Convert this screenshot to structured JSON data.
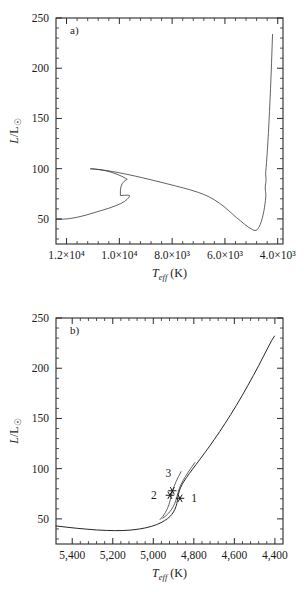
{
  "figure": {
    "kind": "two-panel-hr-diagram",
    "background": "#ffffff",
    "ink": "#262626",
    "top_cropped_text": ""
  },
  "chart_data": [
    {
      "type": "line",
      "panel": "a",
      "panel_label": "a)",
      "title": "",
      "xlabel": "T_eff (K)",
      "ylabel": "L/L☉",
      "xlim": [
        12400,
        3800
      ],
      "ylim": [
        25,
        250
      ],
      "x_reversed": true,
      "grid": false,
      "legend": "none",
      "xticks": [
        12000,
        10000,
        8000,
        6000,
        4000
      ],
      "xticklabels": [
        "1.2×10⁴",
        "1.0×10⁴",
        "8.0×10³",
        "6.0×10³",
        "4.0×10³"
      ],
      "xminor_per_interval": 4,
      "yticks": [
        50,
        100,
        150,
        200,
        250
      ],
      "yticklabels": [
        "50",
        "100",
        "150",
        "200",
        "250"
      ],
      "yminor_per_interval": 4,
      "series": [
        {
          "name": "evolutionary-track",
          "comment": "main sequence to RGB tip; x = Teff (K), y = L/Lsun",
          "points": [
            [
              12400,
              49.5
            ],
            [
              12200,
              49.6
            ],
            [
              11900,
              50.2
            ],
            [
              11600,
              51.6
            ],
            [
              11300,
              53.5
            ],
            [
              11000,
              55.8
            ],
            [
              10700,
              58.2
            ],
            [
              10400,
              60.6
            ],
            [
              10150,
              63.0
            ],
            [
              9950,
              65.2
            ],
            [
              9800,
              67.4
            ],
            [
              9700,
              69.6
            ],
            [
              9640,
              71.4
            ],
            [
              9615,
              72.6
            ],
            [
              9620,
              73.4
            ],
            [
              9680,
              73.6
            ],
            [
              9800,
              73.5
            ],
            [
              9900,
              73.4
            ],
            [
              9960,
              73.2
            ],
            [
              9960,
              78.0
            ],
            [
              9940,
              82.0
            ],
            [
              9890,
              85.2
            ],
            [
              9820,
              87.4
            ],
            [
              9760,
              88.6
            ],
            [
              9720,
              89.1
            ],
            [
              9700,
              89.3
            ],
            [
              9760,
              90.4
            ],
            [
              9900,
              92.3
            ],
            [
              10050,
              94.0
            ],
            [
              10200,
              95.5
            ],
            [
              10350,
              96.8
            ],
            [
              10500,
              97.8
            ],
            [
              10650,
              98.6
            ],
            [
              10800,
              99.2
            ],
            [
              10950,
              99.6
            ],
            [
              11050,
              99.8
            ],
            [
              11100,
              99.85
            ],
            [
              11050,
              99.8
            ],
            [
              10900,
              99.5
            ],
            [
              10700,
              98.9
            ],
            [
              10500,
              98.2
            ],
            [
              10250,
              97.1
            ],
            [
              10000,
              95.9
            ],
            [
              9700,
              94.3
            ],
            [
              9400,
              92.6
            ],
            [
              9100,
              90.8
            ],
            [
              8800,
              88.9
            ],
            [
              8500,
              87.0
            ],
            [
              8200,
              85.0
            ],
            [
              7900,
              83.0
            ],
            [
              7600,
              81.0
            ],
            [
              7300,
              78.8
            ],
            [
              7000,
              76.3
            ],
            [
              6800,
              74.3
            ],
            [
              6600,
              71.9
            ],
            [
              6400,
              69.0
            ],
            [
              6200,
              65.5
            ],
            [
              6000,
              61.5
            ],
            [
              5850,
              58.0
            ],
            [
              5700,
              54.5
            ],
            [
              5550,
              51.0
            ],
            [
              5400,
              47.8
            ],
            [
              5250,
              44.5
            ],
            [
              5100,
              41.6
            ],
            [
              5000,
              40.0
            ],
            [
              4950,
              39.2
            ],
            [
              4900,
              38.7
            ],
            [
              4860,
              38.5
            ],
            [
              4820,
              38.6
            ],
            [
              4780,
              39.2
            ],
            [
              4740,
              40.4
            ],
            [
              4700,
              42.2
            ],
            [
              4660,
              44.6
            ],
            [
              4620,
              47.6
            ],
            [
              4580,
              51.2
            ],
            [
              4550,
              54.5
            ],
            [
              4520,
              58.4
            ],
            [
              4500,
              61.6
            ],
            [
              4480,
              65.2
            ],
            [
              4465,
              68.4
            ],
            [
              4455,
              71.0
            ],
            [
              4450,
              73.0
            ],
            [
              4452,
              75.0
            ],
            [
              4460,
              77.2
            ],
            [
              4472,
              79.8
            ],
            [
              4470,
              82.6
            ],
            [
              4458,
              85.0
            ],
            [
              4448,
              87.2
            ],
            [
              4444,
              89.2
            ],
            [
              4448,
              91.6
            ],
            [
              4458,
              94.4
            ],
            [
              4452,
              97.4
            ],
            [
              4440,
              101.0
            ],
            [
              4425,
              106.0
            ],
            [
              4408,
              112.0
            ],
            [
              4390,
              119.0
            ],
            [
              4372,
              127.0
            ],
            [
              4352,
              136.0
            ],
            [
              4332,
              146.0
            ],
            [
              4312,
              157.0
            ],
            [
              4292,
              168.0
            ],
            [
              4272,
              180.0
            ],
            [
              4252,
              193.0
            ],
            [
              4235,
              205.0
            ],
            [
              4220,
              216.0
            ],
            [
              4208,
              225.0
            ],
            [
              4200,
              231.0
            ],
            [
              4196,
              234.0
            ]
          ]
        }
      ],
      "annotations": []
    },
    {
      "type": "line",
      "panel": "b",
      "panel_label": "b)",
      "title": "",
      "xlabel": "T_eff (K)",
      "ylabel": "L/L☉",
      "xlim": [
        5480,
        4360
      ],
      "ylim": [
        25,
        250
      ],
      "x_reversed": true,
      "grid": false,
      "legend": "none",
      "xticks": [
        5400,
        5200,
        5000,
        4800,
        4600,
        4400
      ],
      "xticklabels": [
        "5,400",
        "5,200",
        "5,000",
        "4,800",
        "4,600",
        "4,400"
      ],
      "xminor_per_interval": 4,
      "yticks": [
        50,
        100,
        150,
        200,
        250
      ],
      "yticklabels": [
        "50",
        "100",
        "150",
        "200",
        "250"
      ],
      "yminor_per_interval": 4,
      "series": [
        {
          "name": "rgb-track-main",
          "comment": "zoom of RGB: x = Teff (K), y = L/Lsun",
          "points": [
            [
              5480,
              43.0
            ],
            [
              5430,
              41.8
            ],
            [
              5380,
              40.7
            ],
            [
              5330,
              39.8
            ],
            [
              5280,
              39.0
            ],
            [
              5230,
              38.5
            ],
            [
              5190,
              38.3
            ],
            [
              5150,
              38.4
            ],
            [
              5110,
              38.9
            ],
            [
              5070,
              39.9
            ],
            [
              5040,
              41.0
            ],
            [
              5010,
              42.5
            ],
            [
              4985,
              44.2
            ],
            [
              4962,
              46.2
            ],
            [
              4945,
              48.2
            ],
            [
              4930,
              50.2
            ],
            [
              4918,
              52.3
            ],
            [
              4908,
              54.6
            ],
            [
              4900,
              57.0
            ],
            [
              4893,
              59.6
            ],
            [
              4888,
              62.4
            ],
            [
              4884,
              65.2
            ],
            [
              4881,
              68.2
            ],
            [
              4879,
              71.2
            ],
            [
              4876,
              74.4
            ],
            [
              4872,
              77.6
            ],
            [
              4866,
              80.8
            ],
            [
              4858,
              84.2
            ],
            [
              4848,
              87.6
            ],
            [
              4836,
              91.2
            ],
            [
              4822,
              95.2
            ],
            [
              4806,
              99.6
            ],
            [
              4788,
              104.4
            ],
            [
              4768,
              109.8
            ],
            [
              4746,
              115.8
            ],
            [
              4722,
              122.4
            ],
            [
              4698,
              129.4
            ],
            [
              4672,
              137.0
            ],
            [
              4646,
              145.0
            ],
            [
              4618,
              153.8
            ],
            [
              4590,
              163.0
            ],
            [
              4562,
              172.6
            ],
            [
              4534,
              182.6
            ],
            [
              4506,
              192.8
            ],
            [
              4480,
              202.6
            ],
            [
              4456,
              212.0
            ],
            [
              4434,
              220.6
            ],
            [
              4416,
              227.6
            ],
            [
              4402,
              232.0
            ]
          ]
        },
        {
          "name": "rgb-track-secondary",
          "comment": "second overlapping track / bump branch",
          "points": [
            [
              4955,
              50.4
            ],
            [
              4938,
              53.0
            ],
            [
              4924,
              55.8
            ],
            [
              4912,
              58.8
            ],
            [
              4902,
              62.0
            ],
            [
              4894,
              65.4
            ],
            [
              4888,
              68.8
            ],
            [
              4883,
              72.4
            ],
            [
              4878,
              76.2
            ],
            [
              4872,
              80.0
            ],
            [
              4864,
              83.8
            ],
            [
              4854,
              87.8
            ],
            [
              4842,
              92.0
            ],
            [
              4828,
              96.4
            ],
            [
              4812,
              101.2
            ],
            [
              4794,
              106.4
            ]
          ]
        },
        {
          "name": "rgb-track-bump-loop",
          "comment": "short loop segment crossing near markers",
          "points": [
            [
              4968,
              49.0
            ],
            [
              4952,
              52.6
            ],
            [
              4940,
              56.4
            ],
            [
              4930,
              60.4
            ],
            [
              4922,
              64.6
            ],
            [
              4916,
              69.0
            ],
            [
              4911,
              73.4
            ],
            [
              4905,
              77.8
            ],
            [
              4898,
              82.2
            ],
            [
              4888,
              87.0
            ],
            [
              4876,
              92.0
            ],
            [
              4862,
              97.4
            ]
          ]
        }
      ],
      "markers": [
        {
          "label": "1",
          "x": 4868,
          "y": 70.5,
          "glyph": "asterisk",
          "label_dx": 14,
          "label_dy": 4
        },
        {
          "label": "2",
          "x": 4918,
          "y": 73.5,
          "glyph": "asterisk",
          "label_dx": -16,
          "label_dy": 4
        },
        {
          "label": "3",
          "x": 4906,
          "y": 78.0,
          "glyph": "asterisk",
          "label_dx": -4,
          "label_dy": -14
        }
      ],
      "annotations": [
        {
          "text": "3",
          "role": "point-label"
        },
        {
          "text": "2",
          "role": "point-label"
        },
        {
          "text": "1",
          "role": "point-label"
        }
      ]
    }
  ]
}
